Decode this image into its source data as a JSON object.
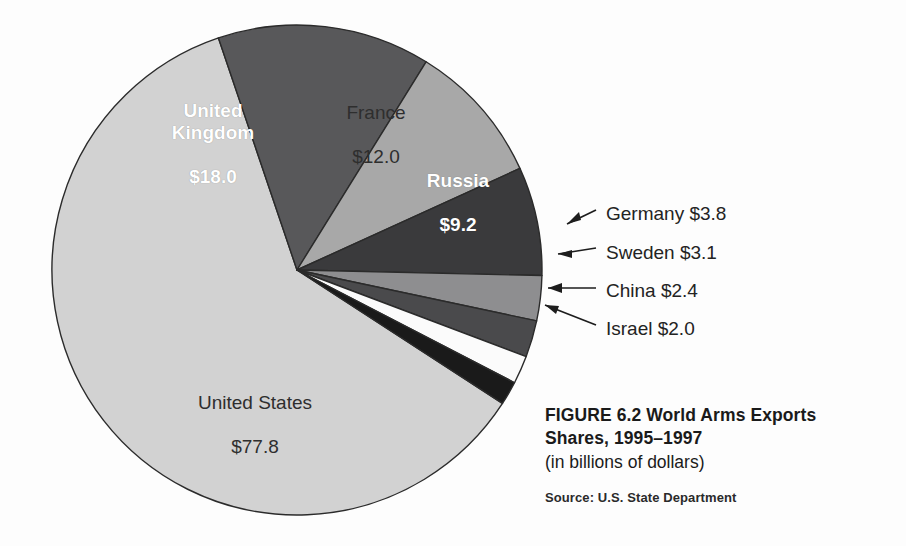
{
  "chart_data": {
    "type": "pie",
    "title": "FIGURE 6.2  World Arms Exports Shares, 1995–1997",
    "subtitle": "(in billions of dollars)",
    "source": "Source: U.S. State Department",
    "unit": "billions of dollars",
    "total": 128.3,
    "legend": "none",
    "grid": false,
    "categories": [
      "United States",
      "United Kingdom",
      "France",
      "Russia",
      "Germany",
      "Sweden",
      "China",
      "Israel"
    ],
    "values": [
      77.8,
      18.0,
      12.0,
      9.2,
      3.8,
      3.1,
      2.4,
      2.0
    ],
    "labels": [
      "$77.8",
      "$18.0",
      "$12.0",
      "$9.2",
      "$3.8",
      "$3.1",
      "$2.4",
      "$2.0"
    ],
    "slices": [
      {
        "name": "United States",
        "value": 77.8,
        "value_label": "$77.8",
        "color": "#d2d2d2",
        "label_placement": "inside",
        "text_color": "dark",
        "start_angle": 123.0,
        "end_angle": 341.3
      },
      {
        "name": "United Kingdom",
        "value": 18.0,
        "value_label": "$18.0",
        "color": "#58585a",
        "label_placement": "inside",
        "text_color": "light",
        "start_angle": 341.3,
        "end_angle": 391.8
      },
      {
        "name": "France",
        "value": 12.0,
        "value_label": "$12.0",
        "color": "#a8a8a8",
        "label_placement": "inside",
        "text_color": "dark",
        "start_angle": 391.8,
        "end_angle": 425.5
      },
      {
        "name": "Russia",
        "value": 9.2,
        "value_label": "$9.2",
        "color": "#3a3a3c",
        "label_placement": "inside",
        "text_color": "light",
        "start_angle": 425.5,
        "end_angle": 451.3
      },
      {
        "name": "Germany",
        "value": 3.8,
        "value_label": "$3.8",
        "color": "#8e8e90",
        "label_placement": "callout",
        "text_color": "dark",
        "start_angle": 451.3,
        "end_angle": 462.0
      },
      {
        "name": "Sweden",
        "value": 3.1,
        "value_label": "$3.1",
        "color": "#4a4a4c",
        "label_placement": "callout",
        "text_color": "dark",
        "start_angle": 462.0,
        "end_angle": 470.7
      },
      {
        "name": "China",
        "value": 2.4,
        "value_label": "$2.4",
        "color": "#fbfbfb",
        "label_placement": "callout",
        "text_color": "dark",
        "start_angle": 470.7,
        "end_angle": 477.4
      },
      {
        "name": "Israel",
        "value": 2.0,
        "value_label": "$2.0",
        "color": "#1a1a1a",
        "label_placement": "callout",
        "text_color": "dark",
        "start_angle": 477.4,
        "end_angle": 483.0
      }
    ]
  },
  "pie": {
    "center_x": 297,
    "center_y": 270,
    "radius": 245,
    "outline_color": "#2b2b2b",
    "slice_labels": {
      "united_kingdom": {
        "name": "United Kingdom",
        "value": "$18.0"
      },
      "france": {
        "name": "France",
        "value": "$12.0"
      },
      "russia": {
        "name": "Russia",
        "value": "$9.2"
      },
      "united_states": {
        "name": "United States",
        "value": "$77.8"
      }
    }
  },
  "callouts": [
    {
      "id": "germany",
      "text": "Germany $3.8"
    },
    {
      "id": "sweden",
      "text": "Sweden $3.1"
    },
    {
      "id": "china",
      "text": "China $2.4"
    },
    {
      "id": "israel",
      "text": "Israel $2.0"
    }
  ],
  "caption": {
    "title_line1": "FIGURE 6.2  World Arms Exports",
    "title_line2": "Shares, 1995–1997",
    "subtitle": "(in billions of dollars)",
    "source": "Source: U.S. State Department"
  }
}
